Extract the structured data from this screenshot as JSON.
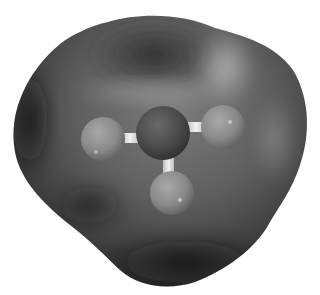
{
  "image": {
    "description": "Grayscale 3D render of a small molecule (central atom bonded to three atoms, ball-and-stick) enclosed in a smooth electron-density isosurface",
    "background_color": "#ffffff",
    "surface_color_dark": "#1e1e1e",
    "surface_color_mid": "#5a5a5a",
    "surface_color_light": "#9a9a9a",
    "central_atom_color": "#4a4a4a",
    "outer_atom_color": "#8a8a8a",
    "bond_color": "#e6e6e6"
  },
  "molecule": {
    "central_atom": {
      "cx": 163,
      "cy": 133,
      "r": 27
    },
    "outer_atoms": [
      {
        "name": "left",
        "cx": 103,
        "cy": 139,
        "r": 22
      },
      {
        "name": "right",
        "cx": 223,
        "cy": 127,
        "r": 22
      },
      {
        "name": "bottom",
        "cx": 172,
        "cy": 193,
        "r": 22
      }
    ]
  }
}
